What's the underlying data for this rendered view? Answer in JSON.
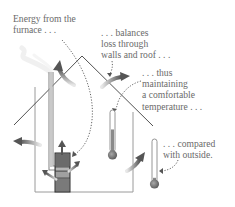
{
  "diagram": {
    "title": "",
    "captions": {
      "energy": [
        "Energy from the",
        "furnace . . ."
      ],
      "balances": [
        ". . . balances",
        "loss through",
        "walls and roof . . ."
      ],
      "thus": [
        ". . . thus",
        "maintaining",
        "a comfortable",
        "temperature . . ."
      ],
      "compared": [
        ". . . compared",
        "with outside."
      ]
    },
    "elements": {
      "house": "house-outline",
      "furnace": "furnace",
      "chimney": "chimney",
      "smoke": "smoke",
      "thermometer_inside": "thermometer-inside",
      "thermometer_outside": "thermometer-outside"
    },
    "thermometers": {
      "inside_fill_fraction": 0.55,
      "outside_fill_fraction": 0.1
    },
    "colors": {
      "arrow": "#5a5a5a",
      "arrow_tail": "#d8d8d8",
      "line": "#4a4a4a",
      "wall": "#9a9a9a",
      "text": "#6a6a6a",
      "mercury": "#8a8a8a",
      "bulb": "#7a7a7a",
      "furnace_dark": "#6b6b6b",
      "furnace_light": "#b5b5b5"
    }
  }
}
